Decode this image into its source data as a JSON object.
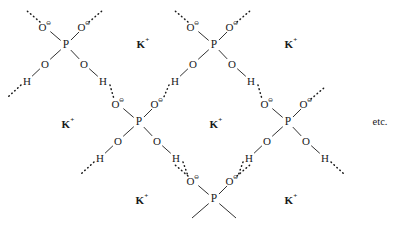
{
  "figure": {
    "background_color": "#ffffff",
    "ink_color": "#1a1a1a",
    "width": 403,
    "height": 228
  },
  "labels": {
    "phosphorus": "P",
    "oxygen": "O",
    "hydrogen": "H",
    "potassium": "K",
    "potassium_charge": "+",
    "oxygen_charge": "⊖",
    "etc": "etc."
  },
  "ions": [
    {
      "id": "k1",
      "text": "K",
      "charge": "+",
      "x": 143,
      "y": 44
    },
    {
      "id": "k2",
      "text": "K",
      "charge": "+",
      "x": 291,
      "y": 44
    },
    {
      "id": "k3",
      "text": "K",
      "charge": "+",
      "x": 68,
      "y": 124
    },
    {
      "id": "k4",
      "text": "K",
      "charge": "+",
      "x": 216,
      "y": 124
    },
    {
      "id": "k5",
      "text": "K",
      "charge": "+",
      "x": 142,
      "y": 200
    },
    {
      "id": "k6",
      "text": "K",
      "charge": "+",
      "x": 291,
      "y": 200
    }
  ],
  "annotations": [
    {
      "id": "etc",
      "text": "etc.",
      "x": 380,
      "y": 122
    }
  ],
  "phosphates": [
    {
      "id": "p-top-left",
      "center": {
        "x": 66,
        "y": 45
      },
      "oxygens": [
        {
          "pos": "upper-left",
          "x": 45,
          "y": 27,
          "charged": true,
          "lone_pairs": true
        },
        {
          "pos": "upper-right",
          "x": 84,
          "y": 27,
          "charged": true,
          "lone_pairs": true
        },
        {
          "pos": "lower-left",
          "x": 45,
          "y": 64,
          "charged": false,
          "lone_pairs": false
        },
        {
          "pos": "lower-right",
          "x": 84,
          "y": 64,
          "charged": false,
          "lone_pairs": false
        }
      ],
      "hydrogens": [
        {
          "pos": "left",
          "x": 27,
          "y": 81
        },
        {
          "pos": "right",
          "x": 103,
          "y": 81
        }
      ]
    },
    {
      "id": "p-top-right",
      "center": {
        "x": 214,
        "y": 45
      },
      "oxygens": [
        {
          "pos": "upper-left",
          "x": 193,
          "y": 27,
          "charged": true,
          "lone_pairs": true
        },
        {
          "pos": "upper-right",
          "x": 232,
          "y": 27,
          "charged": true,
          "lone_pairs": true
        },
        {
          "pos": "lower-left",
          "x": 193,
          "y": 64,
          "charged": false,
          "lone_pairs": false
        },
        {
          "pos": "lower-right",
          "x": 232,
          "y": 64,
          "charged": false,
          "lone_pairs": false
        }
      ],
      "hydrogens": [
        {
          "pos": "left",
          "x": 175,
          "y": 81
        },
        {
          "pos": "right",
          "x": 251,
          "y": 81
        }
      ]
    },
    {
      "id": "p-mid-center",
      "center": {
        "x": 139,
        "y": 122
      },
      "oxygens": [
        {
          "pos": "upper-left",
          "x": 118,
          "y": 104,
          "charged": true,
          "lone_pairs": true
        },
        {
          "pos": "upper-right",
          "x": 157,
          "y": 104,
          "charged": true,
          "lone_pairs": true
        },
        {
          "pos": "lower-left",
          "x": 118,
          "y": 141,
          "charged": false,
          "lone_pairs": false
        },
        {
          "pos": "lower-right",
          "x": 157,
          "y": 141,
          "charged": false,
          "lone_pairs": false
        }
      ],
      "hydrogens": [
        {
          "pos": "left",
          "x": 100,
          "y": 158
        },
        {
          "pos": "right",
          "x": 176,
          "y": 158
        }
      ]
    },
    {
      "id": "p-mid-right",
      "center": {
        "x": 288,
        "y": 122
      },
      "oxygens": [
        {
          "pos": "upper-left",
          "x": 267,
          "y": 104,
          "charged": true,
          "lone_pairs": true
        },
        {
          "pos": "upper-right",
          "x": 306,
          "y": 104,
          "charged": true,
          "lone_pairs": true
        },
        {
          "pos": "lower-left",
          "x": 267,
          "y": 141,
          "charged": false,
          "lone_pairs": false
        },
        {
          "pos": "lower-right",
          "x": 306,
          "y": 141,
          "charged": false,
          "lone_pairs": false
        }
      ],
      "hydrogens": [
        {
          "pos": "left",
          "x": 249,
          "y": 158
        },
        {
          "pos": "right",
          "x": 325,
          "y": 158
        }
      ]
    },
    {
      "id": "p-bottom-center",
      "center": {
        "x": 214,
        "y": 199
      },
      "truncated": true,
      "oxygens": [
        {
          "pos": "upper-left",
          "x": 193,
          "y": 181,
          "charged": true,
          "lone_pairs": true
        },
        {
          "pos": "upper-right",
          "x": 232,
          "y": 181,
          "charged": true,
          "lone_pairs": true
        }
      ],
      "hydrogens": []
    }
  ],
  "hydrogen_bonds": [
    {
      "from": "h-top-left-right",
      "to": "o-mid-center-upper-left",
      "x1": 110,
      "y1": 85,
      "x2": 114,
      "y2": 99
    },
    {
      "from": "h-top-right-left",
      "to": "o-mid-center-upper-right",
      "x1": 169,
      "y1": 85,
      "x2": 163,
      "y2": 99
    },
    {
      "from": "h-top-right-right",
      "to": "o-mid-right-upper-left",
      "x1": 258,
      "y1": 85,
      "x2": 262,
      "y2": 99
    },
    {
      "from": "h-mid-center-right",
      "to": "o-bottom-upper-left",
      "x1": 183,
      "y1": 162,
      "x2": 188,
      "y2": 176
    },
    {
      "from": "h-mid-right-left",
      "to": "o-bottom-upper-right",
      "x1": 243,
      "y1": 162,
      "x2": 238,
      "y2": 176
    },
    {
      "from": "h-top-left-left",
      "to": "off-edge-lower-left",
      "x1": 21,
      "y1": 85,
      "x2": 8,
      "y2": 97
    },
    {
      "from": "h-mid-center-left",
      "to": "off-edge-lower-left",
      "x1": 94,
      "y1": 162,
      "x2": 81,
      "y2": 174
    },
    {
      "from": "h-mid-right-right",
      "to": "off-edge-lower-right",
      "x1": 331,
      "y1": 162,
      "x2": 344,
      "y2": 174
    }
  ],
  "lone_pair_edges": [
    {
      "atom": "o-top-left-upper-left",
      "x1": 40,
      "y1": 22,
      "x2": 26,
      "y2": 10
    },
    {
      "atom": "o-top-left-upper-right",
      "x1": 89,
      "y1": 22,
      "x2": 103,
      "y2": 10
    },
    {
      "atom": "o-top-right-upper-left",
      "x1": 188,
      "y1": 22,
      "x2": 174,
      "y2": 10
    },
    {
      "atom": "o-top-right-upper-right",
      "x1": 237,
      "y1": 22,
      "x2": 251,
      "y2": 10
    },
    {
      "atom": "o-mid-right-upper-right",
      "x1": 311,
      "y1": 99,
      "x2": 325,
      "y2": 87
    },
    {
      "atom": "o-bottom-upper-left-lp",
      "x1": 188,
      "y1": 176,
      "x2": 174,
      "y2": 164
    },
    {
      "atom": "o-bottom-upper-right-lp",
      "x1": 237,
      "y1": 176,
      "x2": 251,
      "y2": 164
    }
  ]
}
